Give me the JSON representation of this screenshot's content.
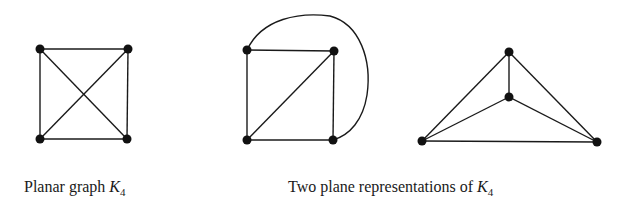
{
  "figures": [
    {
      "id": "planar-k4",
      "caption": {
        "text": "Planar graph ",
        "var": "K",
        "sub": "4"
      },
      "nodes": [
        {
          "x": 40,
          "y": 49
        },
        {
          "x": 128,
          "y": 49
        },
        {
          "x": 40,
          "y": 139
        },
        {
          "x": 127,
          "y": 139
        }
      ],
      "edges": [
        [
          0,
          1
        ],
        [
          1,
          3
        ],
        [
          3,
          2
        ],
        [
          2,
          0
        ],
        [
          0,
          3
        ],
        [
          1,
          2
        ]
      ]
    },
    {
      "id": "plane-rep-1",
      "nodes": [
        {
          "x": 247,
          "y": 50
        },
        {
          "x": 334,
          "y": 51
        },
        {
          "x": 247,
          "y": 140
        },
        {
          "x": 333,
          "y": 140
        }
      ],
      "edges": [
        [
          0,
          1
        ],
        [
          1,
          3
        ],
        [
          3,
          2
        ],
        [
          2,
          0
        ],
        [
          2,
          1
        ]
      ],
      "curved_edge": [
        0,
        3
      ]
    },
    {
      "id": "plane-rep-2",
      "nodes": [
        {
          "x": 509,
          "y": 52
        },
        {
          "x": 509,
          "y": 97
        },
        {
          "x": 422,
          "y": 141
        },
        {
          "x": 597,
          "y": 142
        }
      ],
      "edges": [
        [
          0,
          1
        ],
        [
          0,
          2
        ],
        [
          0,
          3
        ],
        [
          1,
          2
        ],
        [
          1,
          3
        ],
        [
          2,
          3
        ]
      ]
    }
  ],
  "captions": {
    "left": {
      "text": "Planar graph ",
      "var": "K",
      "sub": "4"
    },
    "right": {
      "text": "Two plane representations of ",
      "var": "K",
      "sub": "4"
    }
  },
  "colors": {
    "ink": "#1a1a1a",
    "background": "#ffffff"
  }
}
